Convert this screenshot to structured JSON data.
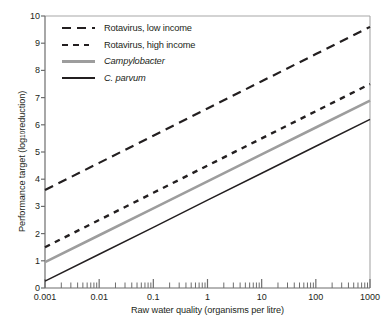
{
  "figure": {
    "background_color": "#ffffff",
    "frame_color": "#a7a7a7",
    "text_color": "#231f20"
  },
  "axes": {
    "y_title_main": "Performance target (log",
    "y_title_sub": "10",
    "y_title_tail": " reduction)",
    "y_title_full": "Performance target (log10 reduction)",
    "x_title": "Raw water quality (organisms per litre)",
    "y_ticks": [
      "0",
      "1",
      "2",
      "3",
      "4",
      "5",
      "6",
      "7",
      "8",
      "9",
      "10"
    ],
    "x_ticks": [
      "0.001",
      "0.01",
      "0.1",
      "1",
      "10",
      "100",
      "1000"
    ]
  },
  "legend": {
    "items": [
      {
        "label": "Rotavirus, low income",
        "style": "dash-long",
        "color": "#231f20",
        "italic": false
      },
      {
        "label": "Rotavirus, high income",
        "style": "dash-short",
        "color": "#231f20",
        "italic": false
      },
      {
        "label": "Campylobacter",
        "style": "solid-gray",
        "color": "#9d9d9d",
        "italic": true
      },
      {
        "label": "C. parvum",
        "style": "solid-black",
        "color": "#231f20",
        "italic": true
      }
    ]
  },
  "chart_data": {
    "type": "line",
    "title": "",
    "xlabel": "Raw water quality (organisms per litre)",
    "ylabel": "Performance target (log10 reduction)",
    "x_scale": "log",
    "y_scale": "linear",
    "xlim": [
      0.001,
      1000
    ],
    "ylim": [
      0,
      10
    ],
    "grid": false,
    "legend_position": "top-left inside",
    "x": [
      0.001,
      0.01,
      0.1,
      1,
      10,
      100,
      1000
    ],
    "series": [
      {
        "name": "Rotavirus, low income",
        "color": "#231f20",
        "style": "dashed-long",
        "values": [
          3.6,
          4.6,
          5.6,
          6.6,
          7.6,
          8.6,
          9.6
        ]
      },
      {
        "name": "Rotavirus, high income",
        "color": "#231f20",
        "style": "dashed-short",
        "values": [
          1.5,
          2.5,
          3.5,
          4.5,
          5.5,
          6.5,
          7.5
        ]
      },
      {
        "name": "Campylobacter",
        "color": "#9d9d9d",
        "style": "solid",
        "values": [
          0.95,
          1.94,
          2.93,
          3.92,
          4.91,
          5.9,
          6.89
        ]
      },
      {
        "name": "C. parvum",
        "color": "#231f20",
        "style": "solid",
        "values": [
          0.25,
          1.24,
          2.23,
          3.23,
          4.22,
          5.21,
          6.2
        ]
      }
    ]
  }
}
